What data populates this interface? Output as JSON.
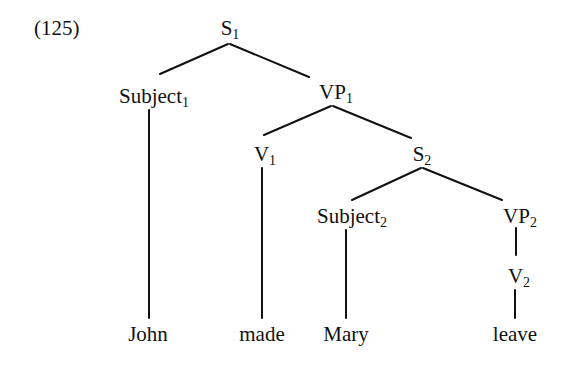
{
  "example_number": "(125)",
  "tree": {
    "nodes": {
      "S1": {
        "label": "S",
        "sub": "1"
      },
      "Subject1": {
        "label": "Subject",
        "sub": "1"
      },
      "VP1": {
        "label": "VP",
        "sub": "1"
      },
      "V1": {
        "label": "V",
        "sub": "1"
      },
      "S2": {
        "label": "S",
        "sub": "2"
      },
      "Subject2": {
        "label": "Subject",
        "sub": "2"
      },
      "VP2": {
        "label": "VP",
        "sub": "2"
      },
      "V2": {
        "label": "V",
        "sub": "2"
      }
    },
    "leaves": {
      "john": "John",
      "made": "made",
      "mary": "Mary",
      "leave": "leave"
    },
    "edges": [
      [
        "S1",
        "Subject1"
      ],
      [
        "S1",
        "VP1"
      ],
      [
        "Subject1",
        "John"
      ],
      [
        "VP1",
        "V1"
      ],
      [
        "VP1",
        "S2"
      ],
      [
        "V1",
        "made"
      ],
      [
        "S2",
        "Subject2"
      ],
      [
        "S2",
        "VP2"
      ],
      [
        "Subject2",
        "Mary"
      ],
      [
        "VP2",
        "V2"
      ],
      [
        "V2",
        "leave"
      ]
    ]
  }
}
